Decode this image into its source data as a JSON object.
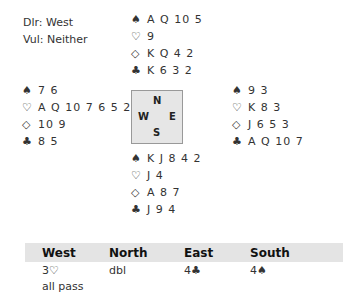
{
  "deal_info": {
    "dealer": "Dlr: West",
    "vulnerability": "Vul: Neither"
  },
  "suit_symbols": {
    "spades": "♠",
    "hearts": "♡",
    "diamonds": "◇",
    "clubs": "♣"
  },
  "hands": {
    "north": {
      "spades": "A Q 10 5",
      "hearts": "9",
      "diamonds": "K Q 4 2",
      "clubs": "K 6 3 2"
    },
    "west": {
      "spades": "7 6",
      "hearts": "A Q 10 7 6 5 2",
      "diamonds": "10 9",
      "clubs": "8 5"
    },
    "east": {
      "spades": "9 3",
      "hearts": "K 8 3",
      "diamonds": "J 6 5 3",
      "clubs": "A Q 10 7"
    },
    "south": {
      "spades": "K J 8 4 2",
      "hearts": "J 4",
      "diamonds": "A 8 7",
      "clubs": "J 9 4"
    }
  },
  "compass": {
    "n": "N",
    "w": "W",
    "e": "E",
    "s": "S"
  },
  "auction": {
    "headers": [
      "West",
      "North",
      "East",
      "South"
    ],
    "rows": [
      [
        "3♡",
        "dbl",
        "4♣",
        "4♠"
      ],
      [
        "all pass",
        "",
        "",
        ""
      ]
    ]
  }
}
